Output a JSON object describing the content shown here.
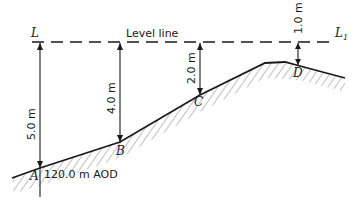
{
  "diagram": {
    "level_line": {
      "label": "Level line",
      "start_label": "L",
      "end_label": "L",
      "end_subscript": "1"
    },
    "points": [
      {
        "id": "A",
        "label": "A",
        "staff_reading": "5.0 m",
        "elevation_label": "120.0 m AOD"
      },
      {
        "id": "B",
        "label": "B",
        "staff_reading": "4.0 m"
      },
      {
        "id": "C",
        "label": "C",
        "staff_reading": "2.0 m"
      },
      {
        "id": "D",
        "label": "D",
        "staff_reading": "1.0 m"
      }
    ],
    "colors": {
      "ink": "#1a1a1a",
      "hatch": "#555555",
      "background": "#ffffff"
    }
  }
}
